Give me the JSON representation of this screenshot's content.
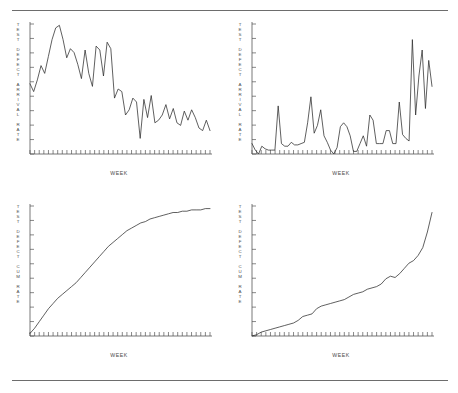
{
  "figure": {
    "background": "#ffffff",
    "line_color": "#2b2b2b",
    "axis_color": "#555555",
    "rule_color": "#6d6d6d",
    "rule_top": true,
    "rule_bottom": true
  },
  "panels": [
    {
      "id": "top-left",
      "ylabel_lines": [
        "T",
        "E",
        "S",
        "T",
        "",
        "D",
        "E",
        "F",
        "E",
        "C",
        "T",
        "",
        "A",
        "R",
        "R",
        "I",
        "V",
        "A",
        "L",
        "",
        "R",
        "A",
        "T",
        "E"
      ],
      "ylabel_text": "TEST DEFECT ARRIVAL RATE",
      "xlabel": "WEEK"
    },
    {
      "id": "top-right",
      "ylabel_lines": [
        "T",
        "E",
        "S",
        "T",
        "",
        "D",
        "E",
        "F",
        "E",
        "C",
        "T",
        "",
        "A",
        "R",
        "R",
        "I",
        "V",
        "A",
        "L",
        "",
        "R",
        "A",
        "T",
        "E"
      ],
      "ylabel_text": "TEST DEFECT ARRIVAL RATE",
      "xlabel": "WEEK"
    },
    {
      "id": "bottom-left",
      "ylabel_lines": [
        "T",
        "E",
        "S",
        "T",
        "",
        "D",
        "E",
        "F",
        "E",
        "C",
        "T",
        "",
        "C",
        "U",
        "M",
        "",
        "R",
        "A",
        "T",
        "E"
      ],
      "ylabel_text": "TEST DEFECT CUM RATE",
      "xlabel": "WEEK"
    },
    {
      "id": "bottom-right",
      "ylabel_lines": [
        "T",
        "E",
        "S",
        "T",
        "",
        "D",
        "E",
        "F",
        "E",
        "C",
        "T",
        "",
        "C",
        "U",
        "M",
        "",
        "R",
        "A",
        "T",
        "E"
      ],
      "ylabel_text": "TEST DEFECT CUM RATE",
      "xlabel": "WEEK"
    }
  ],
  "chart_data": [
    {
      "type": "line",
      "id": "top-left",
      "title": "",
      "xlabel": "WEEK",
      "ylabel": "TEST DEFECT ARRIVAL RATE",
      "xlim": [
        0,
        40
      ],
      "ylim": [
        0,
        100
      ],
      "x_ticks": 40,
      "y_ticks": 9,
      "grid": false,
      "legend": "none",
      "x": [
        0,
        1,
        2,
        3,
        4,
        5,
        6,
        7,
        8,
        9,
        10,
        11,
        12,
        13,
        14,
        15,
        16,
        17,
        18,
        19,
        20,
        21,
        22,
        23,
        24,
        25,
        26,
        27,
        28,
        29,
        30,
        31,
        32,
        33,
        34,
        35,
        36,
        37,
        38,
        39
      ],
      "values": [
        54,
        48,
        57,
        68,
        62,
        75,
        88,
        97,
        99,
        88,
        74,
        81,
        78,
        69,
        58,
        80,
        62,
        52,
        83,
        80,
        60,
        86,
        81,
        43,
        50,
        48,
        30,
        34,
        43,
        40,
        12,
        42,
        28,
        45,
        24,
        26,
        30,
        38,
        27,
        35,
        24,
        22,
        33,
        26,
        34,
        28,
        20,
        18,
        26,
        18
      ]
    },
    {
      "type": "line",
      "id": "top-right",
      "title": "",
      "xlabel": "WEEK",
      "ylabel": "TEST DEFECT ARRIVAL RATE",
      "xlim": [
        0,
        40
      ],
      "ylim": [
        0,
        100
      ],
      "x_ticks": 40,
      "y_ticks": 9,
      "grid": false,
      "legend": "none",
      "x": [
        0,
        1,
        2,
        3,
        4,
        5,
        6,
        7,
        8,
        9,
        10,
        11,
        12,
        13,
        14,
        15,
        16,
        17,
        18,
        19,
        20,
        21,
        22,
        23,
        24,
        25,
        26,
        27,
        28,
        29,
        30,
        31,
        32,
        33,
        34,
        35,
        36,
        37,
        38,
        39
      ],
      "values": [
        8,
        3,
        0,
        6,
        4,
        3,
        3,
        3,
        37,
        8,
        6,
        6,
        9,
        7,
        7,
        8,
        9,
        24,
        44,
        16,
        22,
        34,
        14,
        9,
        3,
        0,
        5,
        21,
        24,
        21,
        14,
        2,
        2,
        8,
        14,
        6,
        30,
        26,
        8,
        8,
        8,
        18,
        18,
        8,
        8,
        40,
        15,
        12,
        10,
        88,
        30,
        60,
        80,
        35,
        72,
        52
      ]
    },
    {
      "type": "line",
      "id": "bottom-left",
      "title": "",
      "xlabel": "WEEK",
      "ylabel": "TEST DEFECT CUM RATE",
      "xlim": [
        0,
        40
      ],
      "ylim": [
        0,
        100
      ],
      "x_ticks": 40,
      "y_ticks": 9,
      "grid": false,
      "legend": "none",
      "shape": "concave-saturating",
      "x": [
        0,
        1,
        2,
        3,
        4,
        5,
        6,
        7,
        8,
        9,
        10,
        11,
        12,
        13,
        14,
        15,
        16,
        17,
        18,
        19,
        20,
        21,
        22,
        23,
        24,
        25,
        26,
        27,
        28,
        29,
        30,
        31,
        32,
        33,
        34,
        35,
        36,
        37,
        38,
        39
      ],
      "values": [
        2,
        6,
        11,
        16,
        21,
        25,
        29,
        32,
        35,
        38,
        41,
        45,
        49,
        53,
        57,
        61,
        65,
        69,
        72,
        75,
        78,
        81,
        83,
        85,
        87,
        88,
        90,
        91,
        92,
        93,
        94,
        95,
        95,
        96,
        96,
        97,
        97,
        97,
        98,
        98
      ]
    },
    {
      "type": "line",
      "id": "bottom-right",
      "title": "",
      "xlabel": "WEEK",
      "ylabel": "TEST DEFECT CUM RATE",
      "xlim": [
        0,
        40
      ],
      "ylim": [
        0,
        100
      ],
      "x_ticks": 40,
      "y_ticks": 9,
      "grid": false,
      "legend": "none",
      "shape": "convex-accelerating",
      "x": [
        0,
        1,
        2,
        3,
        4,
        5,
        6,
        7,
        8,
        9,
        10,
        11,
        12,
        13,
        14,
        15,
        16,
        17,
        18,
        19,
        20,
        21,
        22,
        23,
        24,
        25,
        26,
        27,
        28,
        29,
        30,
        31,
        32,
        33,
        34,
        35,
        36,
        37,
        38,
        39
      ],
      "values": [
        0,
        1,
        3,
        4,
        5,
        6,
        7,
        8,
        9,
        10,
        12,
        15,
        16,
        17,
        21,
        23,
        24,
        25,
        26,
        27,
        28,
        30,
        32,
        33,
        34,
        36,
        37,
        38,
        40,
        44,
        46,
        45,
        48,
        52,
        56,
        58,
        62,
        68,
        80,
        95
      ]
    }
  ]
}
